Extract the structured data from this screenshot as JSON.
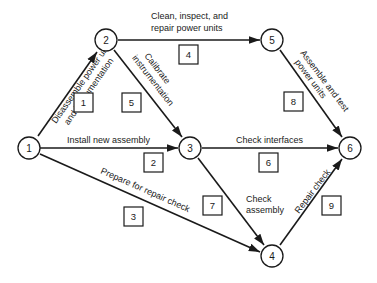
{
  "diagram": {
    "type": "activity-on-arrow network",
    "nodes": [
      {
        "id": "1",
        "label": "1",
        "x": 29,
        "y": 148
      },
      {
        "id": "2",
        "label": "2",
        "x": 106,
        "y": 40
      },
      {
        "id": "3",
        "label": "3",
        "x": 190,
        "y": 148
      },
      {
        "id": "4",
        "label": "4",
        "x": 272,
        "y": 256
      },
      {
        "id": "5",
        "label": "5",
        "x": 272,
        "y": 40
      },
      {
        "id": "6",
        "label": "6",
        "x": 350,
        "y": 148
      }
    ],
    "activities": [
      {
        "number": "1",
        "from": "1",
        "to": "2",
        "label_lines": [
          "Disassemble power units",
          "and instrumentation"
        ]
      },
      {
        "number": "2",
        "from": "1",
        "to": "3",
        "label_lines": [
          "Install new assembly"
        ]
      },
      {
        "number": "3",
        "from": "1",
        "to": "4",
        "label_lines": [
          "Prepare for repair check"
        ]
      },
      {
        "number": "4",
        "from": "2",
        "to": "5",
        "label_lines": [
          "Clean, inspect, and",
          "repair power units"
        ]
      },
      {
        "number": "5",
        "from": "2",
        "to": "3",
        "label_lines": [
          "Calibrate",
          "instrumentation"
        ]
      },
      {
        "number": "6",
        "from": "3",
        "to": "6",
        "label_lines": [
          "Check interfaces"
        ]
      },
      {
        "number": "7",
        "from": "3",
        "to": "4",
        "label_lines": [
          "Check",
          "assembly"
        ]
      },
      {
        "number": "8",
        "from": "5",
        "to": "6",
        "label_lines": [
          "Assemble and test",
          "power units"
        ]
      },
      {
        "number": "9",
        "from": "4",
        "to": "6",
        "label_lines": [
          "Repair check"
        ]
      }
    ]
  }
}
